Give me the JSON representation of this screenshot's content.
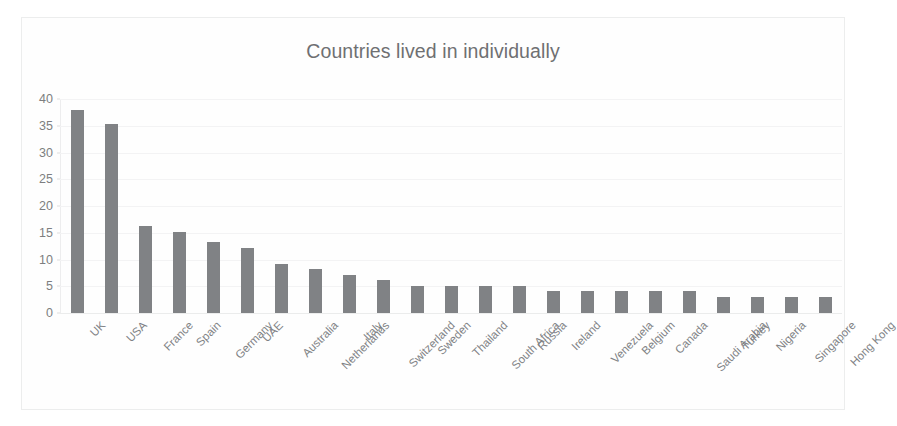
{
  "chart_data": {
    "type": "bar",
    "title": "Countries lived in individually",
    "xlabel": "",
    "ylabel": "",
    "ylim": [
      0,
      40
    ],
    "ytick_step": 5,
    "yticks": [
      0,
      5,
      10,
      15,
      20,
      25,
      30,
      35,
      40
    ],
    "grid": true,
    "grid_axis": "y",
    "legend": false,
    "legend_position": "none",
    "bar_color": "#808285",
    "orientation": "vertical",
    "categories": [
      "UK",
      "USA",
      "France",
      "Spain",
      "Germany",
      "UAE",
      "Australia",
      "Netherlands",
      "Italy",
      "Switzerland",
      "Sweden",
      "Thailand",
      "South Africa",
      "Russia",
      "Ireland",
      "Venezuela",
      "Belgium",
      "Canada",
      "Saudi Arabia",
      "Turkey",
      "Nigeria",
      "Singapore",
      "Hong Kong"
    ],
    "values": [
      38,
      35.3,
      16.3,
      15.2,
      13.2,
      12.2,
      9.2,
      8.2,
      7.1,
      6.1,
      5.1,
      5.1,
      5.1,
      5.1,
      4.1,
      4.1,
      4.1,
      4.1,
      4.1,
      3,
      3,
      3,
      3
    ]
  }
}
